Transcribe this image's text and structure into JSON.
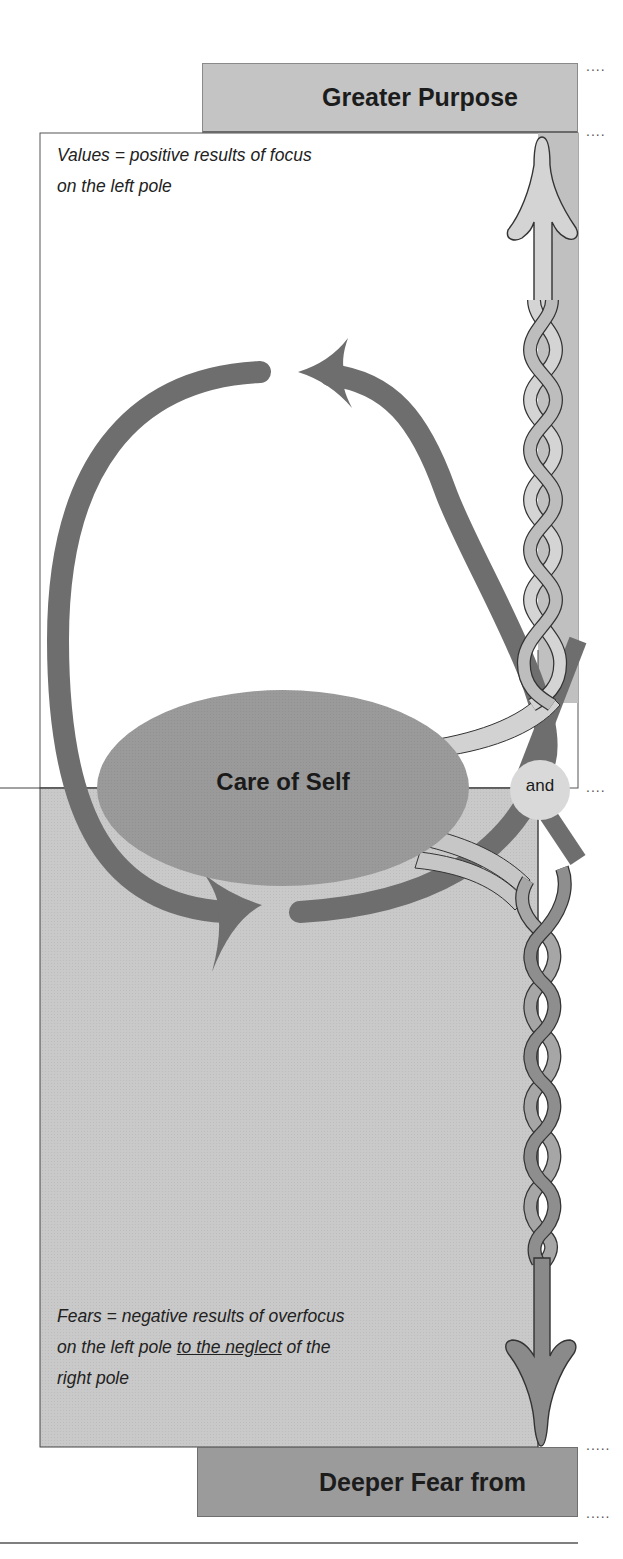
{
  "diagram": {
    "type": "polarity-map-left-half",
    "top_box": {
      "title": "Greater Purpose"
    },
    "upper_quadrant": {
      "note_prefix": "Values = positive results of focus on the left pole",
      "note_line1": "Values = positive results of focus",
      "note_line2": "on the left pole"
    },
    "pole": {
      "label": "Care of Self"
    },
    "connector": {
      "label": "and"
    },
    "lower_quadrant": {
      "note_line1": "Fears = negative results of overfocus",
      "note_line2_pre": "on the left pole ",
      "note_line2_underlined": "to the neglect",
      "note_line2_post": " of the",
      "note_line3": "right pole"
    },
    "bottom_box": {
      "title": "Deeper Fear from"
    },
    "leaders": {
      "dots_short": "....",
      "dots_long": "....."
    },
    "colors": {
      "top_box_fill": "#c4c4c4",
      "bottom_box_fill": "#9b9b9b",
      "upper_quadrant_fill": "#ffffff",
      "lower_quadrant_fill": "#c9c9c9",
      "pole_ellipse_fill": "#9a9a9a",
      "loop_arrow": "#6e6e6e",
      "and_circle": "#d9d9d9",
      "braid_light": "#d2d2d2",
      "braid_dark": "#8e8e8e",
      "side_strip": "#bdbdbd"
    }
  }
}
